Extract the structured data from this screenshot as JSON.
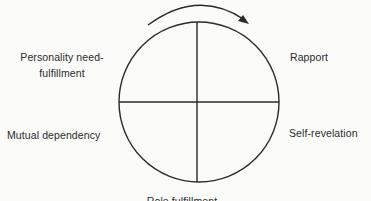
{
  "diagram": {
    "type": "cycle",
    "cycle_direction": "clockwise",
    "stroke_color": "#2a2a2a",
    "background_color": "#fbfbfa",
    "quadrants": [
      {
        "position": "top-left",
        "label_lines": [
          "Personality need-",
          "fulfillment"
        ]
      },
      {
        "position": "top-right",
        "label": "Rapport"
      },
      {
        "position": "bottom-right",
        "label": "Self-revelation"
      },
      {
        "position": "bottom-left",
        "label": "Mutual dependency"
      }
    ],
    "bottom_label_cut_off": "Role fulfillment"
  }
}
